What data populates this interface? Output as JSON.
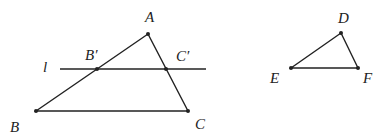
{
  "diagram": {
    "stroke_color": "#222222",
    "labels": {
      "A": "A",
      "B": "B",
      "C": "C",
      "B_prime": "B′",
      "C_prime": "C′",
      "line_l": "l",
      "D": "D",
      "E": "E",
      "F": "F"
    },
    "points": {
      "A": [
        148,
        34
      ],
      "B": [
        36,
        111
      ],
      "C": [
        188,
        111
      ],
      "B_prime": [
        97,
        69
      ],
      "C_prime": [
        166,
        69
      ],
      "D": [
        341,
        33
      ],
      "E": [
        291,
        68
      ],
      "F": [
        358,
        68
      ]
    },
    "line_l": {
      "x1": 60,
      "y": 69,
      "x2": 206
    }
  }
}
